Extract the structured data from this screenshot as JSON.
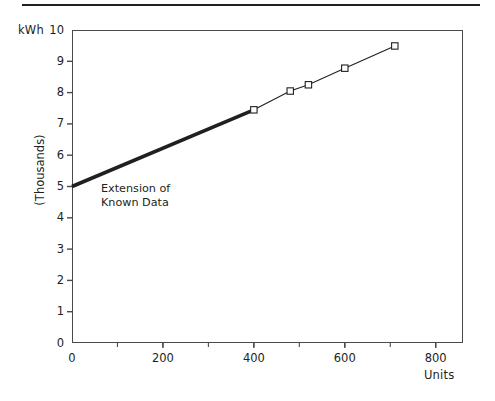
{
  "figure": {
    "has_top_rule": true,
    "y_axis_unit_label": "kWh",
    "y_axis_title": "(Thousands)",
    "x_axis_title": "Units",
    "annotation": "Extension of\nKnown Data",
    "line_color": "#231f20",
    "marker_fill": "#ffffff",
    "frame_color": "#4a4a4a"
  },
  "chart_data": {
    "type": "line",
    "title": "",
    "subtitle": "",
    "xlabel": "Units",
    "ylabel": "kWh (Thousands)",
    "xlim": [
      0,
      860
    ],
    "ylim": [
      0,
      10
    ],
    "xticks": [
      0,
      200,
      400,
      600,
      800
    ],
    "xtick_labels": [
      "0",
      "200",
      "400",
      "600",
      "800"
    ],
    "yticks": [
      0,
      1,
      2,
      3,
      4,
      5,
      6,
      7,
      8,
      9,
      10
    ],
    "ytick_labels": [
      "0",
      "1",
      "2",
      "3",
      "4",
      "5",
      "6",
      "7",
      "8",
      "9",
      "10"
    ],
    "grid": false,
    "legend": "none",
    "annotations": [
      {
        "text": "Extension of Known Data",
        "x": 95,
        "y": 4.6,
        "describes": "thick trend line extrapolated back from the first data point to the y-intercept"
      }
    ],
    "series": [
      {
        "name": "Known Data",
        "style": "thin line with open square markers",
        "x": [
          400,
          480,
          520,
          600,
          710
        ],
        "y": [
          7.45,
          8.05,
          8.25,
          8.78,
          9.49
        ],
        "marker": "open-square"
      },
      {
        "name": "Extension of Known Data",
        "style": "thick line, no markers",
        "x": [
          0,
          400
        ],
        "y": [
          5.0,
          7.45
        ],
        "marker": "none"
      }
    ]
  }
}
